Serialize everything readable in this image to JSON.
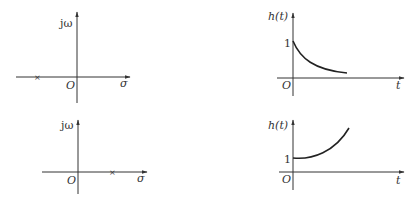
{
  "figure": {
    "panels": [
      {
        "id": "s-plane-left-pole",
        "type": "s-plane",
        "vertical_axis_label": "jω",
        "horizontal_axis_label": "σ",
        "origin_label": "O",
        "pole_marker": "×",
        "pole_position": "negative real axis"
      },
      {
        "id": "response-decaying",
        "type": "time-response",
        "vertical_axis_label": "h(t)",
        "horizontal_axis_label": "t",
        "origin_label": "O",
        "initial_value_label": "1",
        "behavior": "exponential decay"
      },
      {
        "id": "s-plane-right-pole",
        "type": "s-plane",
        "vertical_axis_label": "jω",
        "horizontal_axis_label": "σ",
        "origin_label": "O",
        "pole_marker": "×",
        "pole_position": "positive real axis"
      },
      {
        "id": "response-growing",
        "type": "time-response",
        "vertical_axis_label": "h(t)",
        "horizontal_axis_label": "t",
        "origin_label": "O",
        "initial_value_label": "1",
        "behavior": "exponential growth"
      }
    ]
  }
}
